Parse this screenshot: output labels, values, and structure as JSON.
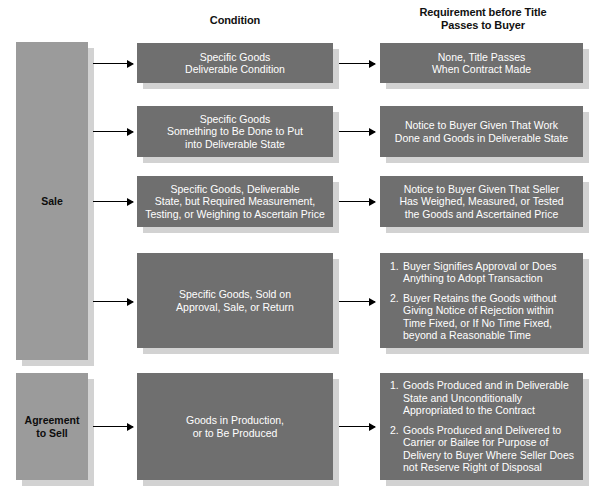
{
  "page": {
    "top_sliver_text": "",
    "colors": {
      "content_box": "#6f6f6f",
      "category_box": "#9b9b9b",
      "shadow": "#d2d2d2",
      "content_text": "#ffffff",
      "category_text": "#0d0d0d",
      "header_text": "#111111",
      "arrow": "#000000",
      "background": "#ffffff"
    }
  },
  "headers": {
    "condition": "Condition",
    "requirement_line1": "Requirement before Title",
    "requirement_line2": "Passes to Buyer"
  },
  "categories": [
    {
      "id": "sale",
      "label": "Sale"
    },
    {
      "id": "agreement-to-sell",
      "label_line1": "Agreement",
      "label_line2": "to Sell"
    }
  ],
  "rows": [
    {
      "id": "row-1",
      "condition": {
        "lines": [
          "Specific Goods",
          "Deliverable Condition"
        ]
      },
      "requirement": {
        "lines": [
          "None, Title Passes",
          "When Contract Made"
        ]
      }
    },
    {
      "id": "row-2",
      "condition": {
        "lines": [
          "Specific Goods",
          "Something to Be Done to Put",
          "into Deliverable State"
        ]
      },
      "requirement": {
        "lines": [
          "Notice to Buyer Given That Work",
          "Done and Goods in Deliverable State"
        ]
      }
    },
    {
      "id": "row-3",
      "condition": {
        "lines": [
          "Specific Goods, Deliverable",
          "State, but Required Measurement,",
          "Testing, or Weighing to Ascertain Price"
        ]
      },
      "requirement": {
        "lines": [
          "Notice to Buyer Given That Seller",
          "Has Weighed, Measured, or Tested",
          "the Goods and Ascertained Price"
        ]
      }
    },
    {
      "id": "row-4",
      "condition": {
        "lines": [
          "Specific Goods, Sold on",
          "Approval, Sale, or Return"
        ]
      },
      "requirement": {
        "numbered": [
          {
            "num": "1.",
            "text": "Buyer Signifies Approval or Does Anything to Adopt Transaction"
          },
          {
            "num": "2.",
            "text": "Buyer Retains the Goods without Giving Notice of Rejection within Time Fixed, or If No Time Fixed, beyond a Reasonable Time"
          }
        ]
      }
    },
    {
      "id": "row-5",
      "condition": {
        "lines": [
          "Goods in Production,",
          "or to Be Produced"
        ]
      },
      "requirement": {
        "numbered": [
          {
            "num": "1.",
            "text": "Goods Produced and in Deliverable State and Unconditionally Appropriated to the Contract"
          },
          {
            "num": "2.",
            "text": "Goods Produced and Delivered to Carrier or Bailee for Purpose of Delivery to Buyer Where Seller Does not Reserve Right of Disposal"
          }
        ]
      }
    }
  ]
}
